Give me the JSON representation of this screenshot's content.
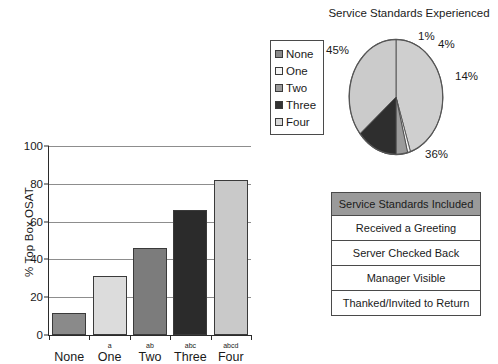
{
  "chart_data": [
    {
      "type": "bar",
      "title": "",
      "xlabel": "",
      "ylabel": "% Top Box OSAT",
      "ylim": [
        0,
        100
      ],
      "yticks": [
        0,
        20,
        40,
        60,
        80,
        100
      ],
      "grid": true,
      "legend_position": "top-right-outside",
      "categories": [
        "None",
        "One",
        "Two",
        "Three",
        "Four"
      ],
      "superscripts": [
        "",
        "a",
        "ab",
        "abc",
        "abcd"
      ],
      "values": [
        11.5,
        31,
        46,
        66,
        82
      ],
      "colors": [
        "#8a8a8a",
        "#dcdcdc",
        "#7c7c7c",
        "#2b2b2b",
        "#c9c9c9"
      ],
      "legend_entries": [
        {
          "label": "None",
          "color": "#8a8a8a"
        },
        {
          "label": "One",
          "color": "#f2f2f2"
        },
        {
          "label": "Two",
          "color": "#9a9a9a"
        },
        {
          "label": "Three",
          "color": "#333333"
        },
        {
          "label": "Four",
          "color": "#d8d8d8"
        }
      ]
    },
    {
      "type": "pie",
      "title": "Service Standards Experienced",
      "labels": [
        "45%",
        "1%",
        "4%",
        "14%",
        "36%"
      ],
      "values": [
        45,
        1,
        4,
        14,
        36
      ],
      "colors": [
        "#cfcfcf",
        "#f4f4f4",
        "#9b9b9b",
        "#2e2e2e",
        "#cbcbcb"
      ],
      "start_angle_deg": 0,
      "direction": "clockwise"
    }
  ],
  "bar_chart": {
    "y_axis_title": "% Top Box OSAT",
    "y_ticks": [
      "0",
      "20",
      "40",
      "60",
      "80",
      "100"
    ],
    "bars": [
      {
        "label": "None",
        "superscript": "",
        "value": 11.5,
        "color": "#8a8a8a"
      },
      {
        "label": "One",
        "superscript": "a",
        "value": 31,
        "color": "#dcdcdc"
      },
      {
        "label": "Two",
        "superscript": "ab",
        "value": 46,
        "color": "#7c7c7c"
      },
      {
        "label": "Three",
        "superscript": "abc",
        "value": 66,
        "color": "#2b2b2b"
      },
      {
        "label": "Four",
        "superscript": "abcd",
        "value": 82,
        "color": "#c9c9c9"
      }
    ]
  },
  "legend": {
    "items": [
      {
        "label": "None",
        "color": "#8a8a8a"
      },
      {
        "label": "One",
        "color": "#f4f4f4"
      },
      {
        "label": "Two",
        "color": "#9a9a9a"
      },
      {
        "label": "Three",
        "color": "#333333"
      },
      {
        "label": "Four",
        "color": "#d8d8d8"
      }
    ]
  },
  "pie_chart": {
    "title": "Service Standards Experienced",
    "slices": [
      {
        "label": "45%",
        "value": 45,
        "color": "#cfcfcf"
      },
      {
        "label": "1%",
        "value": 1,
        "color": "#f4f4f4"
      },
      {
        "label": "4%",
        "value": 4,
        "color": "#9b9b9b"
      },
      {
        "label": "14%",
        "value": 14,
        "color": "#2e2e2e"
      },
      {
        "label": "36%",
        "value": 36,
        "color": "#cbcbcb"
      }
    ]
  },
  "standards_table": {
    "header": "Service Standards Included",
    "header_color": "#9a9a9a",
    "rows": [
      "Received a Greeting",
      "Server Checked Back",
      "Manager Visible",
      "Thanked/Invited to Return"
    ]
  }
}
